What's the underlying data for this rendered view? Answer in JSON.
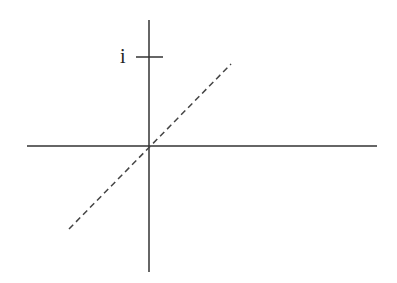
{
  "diagram": {
    "title": "",
    "labels": {
      "imag_tick": "i"
    },
    "colors": {
      "axis": "#333333",
      "dashed_line": "#444444",
      "background": "#ffffff"
    },
    "elements": [
      {
        "type": "horizontal-axis",
        "from": [
          27,
          146
        ],
        "to": [
          377,
          146
        ]
      },
      {
        "type": "vertical-axis",
        "from": [
          149,
          20
        ],
        "to": [
          149,
          272
        ]
      },
      {
        "type": "tick",
        "label": "i",
        "from": [
          136,
          57
        ],
        "to": [
          163,
          57
        ]
      },
      {
        "type": "dashed-line",
        "from": [
          69,
          229
        ],
        "to": [
          231,
          64
        ]
      }
    ]
  }
}
